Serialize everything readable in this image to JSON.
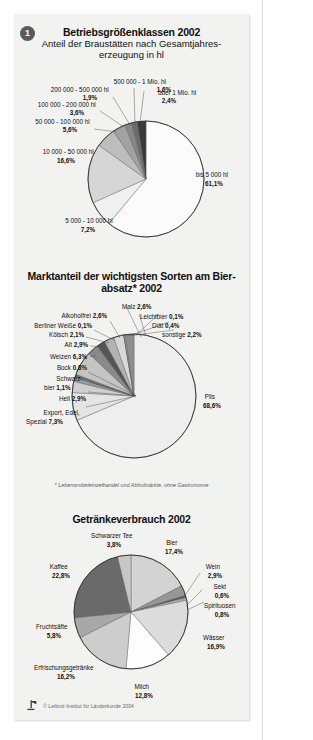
{
  "sheet": {
    "badge": "1",
    "credit": "© Leibniz-Institut für Länderkunde 2004",
    "logo_icon": "leibniz-ifl-logo-icon"
  },
  "panel1": {
    "title": "Betriebsgrößenklassen 2002",
    "subtitle": "Anteil der Braustätten nach Gesamtjahres-erzeugung in hl"
  },
  "panel2": {
    "title": "Marktanteil der wichtigsten Sorten am Bier-absatz* 2002",
    "footnote": "* Lebensmitteleinzelhandel und Abholmärkte, ohne Gastronomie"
  },
  "panel3": {
    "title": "Getränkeverbrauch 2002"
  },
  "chart_data": [
    {
      "id": "betriebsgroessenklassen-2002",
      "type": "pie",
      "title": "Betriebsgrößenklassen 2002",
      "subtitle": "Anteil der Braustätten nach Gesamtjahreserzeugung in hl",
      "unit": "%",
      "legend": "labels-outside-with-leaders",
      "categories": [
        "bis 5 000 hl",
        "5 000 - 10 000 hl",
        "10 000 - 50 000 hl",
        "50 000 - 100 000 hl",
        "100 000 - 200 000 hl",
        "200 000 - 500 000 hl",
        "500 000 - 1 Mio. hl",
        "über 1 Mio. hl"
      ],
      "values": [
        61.1,
        7.2,
        16.6,
        5.6,
        3.6,
        1.9,
        1.6,
        2.4
      ],
      "value_labels": [
        "61,1%",
        "7,2%",
        "16,6%",
        "5,6%",
        "3,6%",
        "1,9%",
        "1,6%",
        "2,4%"
      ],
      "colors": [
        "#fbfbfb",
        "#f0f0f0",
        "#d6d6d6",
        "#bdbdbd",
        "#a2a2a2",
        "#878787",
        "#6b6b6b",
        "#3a3a3a"
      ]
    },
    {
      "id": "marktanteil-biersorten-2002",
      "type": "pie",
      "title": "Marktanteil der wichtigsten Sorten am Bierabsatz* 2002",
      "footnote": "* Lebensmitteleinzelhandel und Abholmärkte, ohne Gastronomie",
      "unit": "%",
      "legend": "labels-outside-with-leaders",
      "categories": [
        "Pils",
        "Export, Edel, Spezial",
        "Hell",
        "Schwarzbier",
        "Bock",
        "Weizen",
        "Alt",
        "Kölsch",
        "Berliner Weiße",
        "Alkoholfrei",
        "Malz",
        "Leichtbier",
        "Diät",
        "sonstige"
      ],
      "values": [
        68.6,
        7.3,
        2.9,
        1.1,
        0.8,
        6.3,
        2.9,
        2.1,
        0.1,
        2.6,
        2.6,
        0.1,
        0.4,
        2.2
      ],
      "value_labels": [
        "68,6%",
        "7,3%",
        "2,9%",
        "1,1%",
        "0,8%",
        "6,3%",
        "2,9%",
        "2,1%",
        "0,1%",
        "2,6%",
        "2,6%",
        "0,1%",
        "0,4%",
        "2,2%"
      ],
      "colors": [
        "#eeeeee",
        "#e4e4e4",
        "#cfcfcf",
        "#9a9a9a",
        "#6f6f6f",
        "#c4c4c4",
        "#8a8a8a",
        "#555555",
        "#2f2f2f",
        "#b3b3b3",
        "#d8d8d8",
        "#707070",
        "#9e9e9e",
        "#8f8f8f"
      ]
    },
    {
      "id": "getraenkeverbrauch-2002",
      "type": "pie",
      "title": "Getränkeverbrauch 2002",
      "unit": "%",
      "legend": "labels-outside-with-leaders",
      "categories": [
        "Bier",
        "Wein",
        "Sekt",
        "Spirituosen",
        "Wässer",
        "Milch",
        "Erfrischungsgetränke",
        "Fruchtsäfte",
        "Kaffee",
        "Schwarzer Tee"
      ],
      "values": [
        17.4,
        2.9,
        0.6,
        0.8,
        16.9,
        12.8,
        16.2,
        5.8,
        22.8,
        3.8
      ],
      "value_labels": [
        "17,4%",
        "2,9%",
        "0,6%",
        "0,8%",
        "16,9%",
        "12,8%",
        "16,2%",
        "5,8%",
        "22,8%",
        "3,8%"
      ],
      "colors": [
        "#d3d3d3",
        "#969696",
        "#585858",
        "#aeaeae",
        "#dcdcdc",
        "#fdfdfd",
        "#cdcdcd",
        "#a8a8a8",
        "#6a6a6a",
        "#c6c6c6"
      ]
    }
  ]
}
